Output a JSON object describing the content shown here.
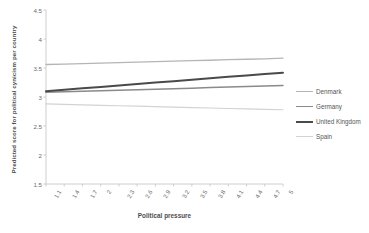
{
  "chart_data": {
    "type": "line",
    "title": "",
    "xlabel": "Political pressure",
    "ylabel": "Predicted score for political cynicism per country",
    "xlim": [
      1.1,
      5.0
    ],
    "ylim": [
      1.5,
      4.5
    ],
    "grid": false,
    "legend_position": "right",
    "x": [
      1.1,
      1.4,
      1.7,
      2,
      2.3,
      2.6,
      2.9,
      3.2,
      3.5,
      3.8,
      4.1,
      4.4,
      4.7,
      5
    ],
    "xticklabels": [
      "1.1",
      "1.4",
      "1.7",
      "2",
      "2.3",
      "2.6",
      "2.9",
      "3.2",
      "3.5",
      "3.8",
      "4.1",
      "4.4",
      "4.7",
      "5"
    ],
    "yticklabels": [
      "4.5",
      "4",
      "3.5",
      "3",
      "2.5",
      "2",
      "1.5"
    ],
    "yticks": [
      4.5,
      4,
      3.5,
      3,
      2.5,
      2,
      1.5
    ],
    "series": [
      {
        "name": "Denmark",
        "color": "#b5b5b5",
        "width": 1.3,
        "endpoints": [
          3.56,
          3.67
        ],
        "values": [
          3.56,
          3.568,
          3.576,
          3.585,
          3.593,
          3.601,
          3.609,
          3.618,
          3.626,
          3.634,
          3.643,
          3.651,
          3.659,
          3.67
        ]
      },
      {
        "name": "Germany",
        "color": "#8a8a8a",
        "width": 1.5,
        "endpoints": [
          3.08,
          3.2
        ],
        "values": [
          3.08,
          3.089,
          3.098,
          3.107,
          3.117,
          3.126,
          3.135,
          3.144,
          3.153,
          3.163,
          3.172,
          3.181,
          3.19,
          3.2
        ]
      },
      {
        "name": "United Kingdom",
        "color": "#4a4a4a",
        "width": 2.0,
        "endpoints": [
          3.1,
          3.42
        ],
        "values": [
          3.1,
          3.125,
          3.149,
          3.174,
          3.199,
          3.223,
          3.248,
          3.273,
          3.297,
          3.322,
          3.347,
          3.371,
          3.396,
          3.42
        ]
      },
      {
        "name": "Spain",
        "color": "#d3d3d3",
        "width": 1.2,
        "endpoints": [
          2.88,
          2.78
        ],
        "values": [
          2.88,
          2.872,
          2.864,
          2.857,
          2.849,
          2.841,
          2.833,
          2.825,
          2.818,
          2.81,
          2.802,
          2.794,
          2.786,
          2.78
        ]
      }
    ]
  },
  "legend": {
    "items": [
      {
        "label": "Denmark"
      },
      {
        "label": "Germany"
      },
      {
        "label": "United Kingdom"
      },
      {
        "label": "Spain"
      }
    ]
  },
  "axes": {
    "axis_color": "#c8c8c8"
  }
}
